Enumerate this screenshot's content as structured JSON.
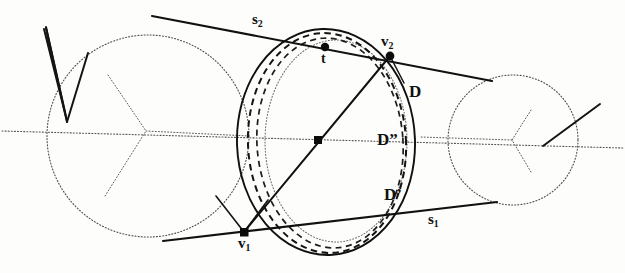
{
  "figure": {
    "kind": "geometry-diagram",
    "background": "#fdfdfc",
    "ink": "#1a1a1a",
    "faint_ink": "#6b6b6b",
    "width": 625,
    "height": 273,
    "labels": {
      "s2": "s",
      "s2_sub": "2",
      "t": "t",
      "v2": "v",
      "v2_sub": "2",
      "D": "D",
      "D_double_prime": "D”",
      "D_prime": "D’",
      "s1": "s",
      "s1_sub": "1",
      "v1": "v",
      "v1_sub": "1"
    },
    "points": [
      {
        "name": "t",
        "x": 325,
        "y": 47
      },
      {
        "name": "v2",
        "x": 390,
        "y": 56
      },
      {
        "name": "center",
        "x": 318,
        "y": 140
      },
      {
        "name": "v1",
        "x": 244,
        "y": 232
      }
    ],
    "shapes": {
      "left_circle": {
        "style": "dotted",
        "cx": 148,
        "cy": 136,
        "r": 101
      },
      "right_circle": {
        "style": "dotted",
        "cx": 513,
        "cy": 140,
        "r": 65
      },
      "disk_D": {
        "style": "solid",
        "cx": 326,
        "cy": 142,
        "rx": 89,
        "ry": 113
      },
      "disk_D_prime": {
        "style": "dashed",
        "cx": 327,
        "cy": 143,
        "rx": 79,
        "ry": 110
      },
      "disk_inner": {
        "style": "dotted",
        "cx": 336,
        "cy": 141,
        "rx": 71,
        "ry": 101
      },
      "axis": {
        "style": "dotted",
        "x1": 0,
        "y1": 131,
        "x2": 625,
        "y2": 148
      },
      "chord_v1_v2": {
        "style": "solid",
        "x1": 244,
        "y1": 232,
        "x2": 390,
        "y2": 56
      },
      "tangent_s2": {
        "style": "solid",
        "x1": 152,
        "y1": 16,
        "x2": 492,
        "y2": 81
      },
      "tangent_s1": {
        "style": "solid",
        "x1": 163,
        "y1": 241,
        "x2": 497,
        "y2": 202
      }
    }
  }
}
